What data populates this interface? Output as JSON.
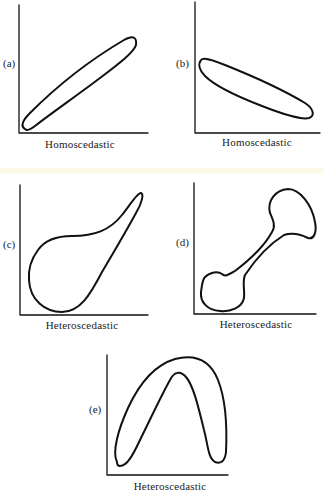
{
  "figure": {
    "panels": [
      {
        "id": "a",
        "label": "(a)",
        "caption": "Homoscedastic",
        "shape": "narrow ellipse rising left-to-right"
      },
      {
        "id": "b",
        "label": "(b)",
        "caption": "Homoscedastic",
        "shape": "narrow ellipse falling left-to-right"
      },
      {
        "id": "c",
        "label": "(c)",
        "caption": "Heteroscedastic",
        "shape": "wide at lower-left, tapering to narrow at upper-right"
      },
      {
        "id": "d",
        "label": "(d)",
        "caption": "Heteroscedastic",
        "shape": "bone-shaped, bulbs at both ends"
      },
      {
        "id": "e",
        "label": "(e)",
        "caption": "Heteroscedastic",
        "shape": "inverted-U arch band"
      }
    ]
  },
  "colors": {
    "ink": "#111111",
    "background": "#ffffff"
  }
}
